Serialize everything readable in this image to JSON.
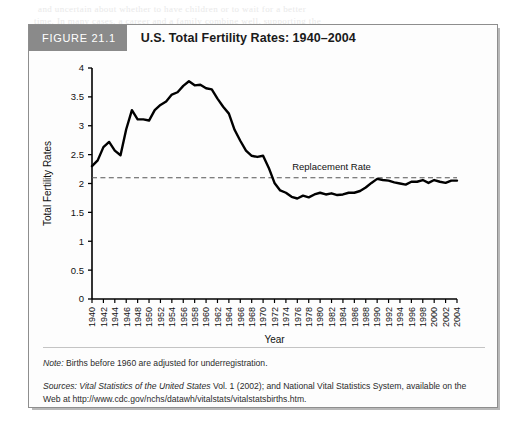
{
  "figure": {
    "badge": "FIGURE 21.1",
    "title": "U.S. Total Fertility Rates: 1940–2004"
  },
  "notes": {
    "note_label": "Note:",
    "note_text": " Births before 1960 are adjusted for underregistration.",
    "sources_label": "Sources:",
    "sources_italic": " Vital Statistics of the United States",
    "sources_text_1": " Vol. 1 (2002); and National Vital Statistics System, available on the",
    "sources_text_2": "Web at http://www.cdc.gov/nchs/datawh/vitalstats/vitalstatsbirths.htm."
  },
  "bleed_text": [
    "and uncertain about whether to have children or to wait for a better",
    "time. In many cases, a career and a family combine well, supporting the"
  ],
  "chart_data": {
    "type": "line",
    "title": "U.S. Total Fertility Rates: 1940–2004",
    "xlabel": "Year",
    "ylabel": "Total Fertility Rates",
    "ylim": [
      0,
      4
    ],
    "xlim": [
      1940,
      2004
    ],
    "yticks": [
      0,
      0.5,
      1,
      1.5,
      2,
      2.5,
      3,
      3.5,
      4
    ],
    "ytick_labels": [
      "0",
      "0.5",
      "1",
      "1.5",
      "2",
      "2.5",
      "3",
      "3.5",
      "4"
    ],
    "xticks": [
      1940,
      1942,
      1944,
      1946,
      1948,
      1950,
      1952,
      1954,
      1956,
      1958,
      1960,
      1962,
      1964,
      1966,
      1968,
      1970,
      1972,
      1974,
      1976,
      1978,
      1980,
      1982,
      1984,
      1986,
      1988,
      1990,
      1992,
      1994,
      1996,
      1998,
      2000,
      2002,
      2004
    ],
    "xtick_labels": [
      "1940",
      "1942",
      "1944",
      "1946",
      "1948",
      "1950",
      "1952",
      "1954",
      "1956",
      "1958",
      "1960",
      "1962",
      "1964",
      "1966",
      "1968",
      "1970",
      "1972",
      "1974",
      "1976",
      "1978",
      "1980",
      "1982",
      "1984",
      "1986",
      "1988",
      "1990",
      "1992",
      "1994",
      "1996",
      "1998",
      "2000",
      "2002",
      "2004"
    ],
    "grid": false,
    "legend": "none",
    "line_color": "#000000",
    "annotations": [
      {
        "name": "replacement-rate",
        "label": "Replacement Rate",
        "y": 2.1,
        "style": "dashed-horizontal-line",
        "color": "#555555"
      }
    ],
    "series": [
      {
        "name": "Total Fertility Rate",
        "x": [
          1940,
          1941,
          1942,
          1943,
          1944,
          1945,
          1946,
          1947,
          1948,
          1949,
          1950,
          1951,
          1952,
          1953,
          1954,
          1955,
          1956,
          1957,
          1958,
          1959,
          1960,
          1961,
          1962,
          1963,
          1964,
          1965,
          1966,
          1967,
          1968,
          1969,
          1970,
          1971,
          1972,
          1973,
          1974,
          1975,
          1976,
          1977,
          1978,
          1979,
          1980,
          1981,
          1982,
          1983,
          1984,
          1985,
          1986,
          1987,
          1988,
          1989,
          1990,
          1991,
          1992,
          1993,
          1994,
          1995,
          1996,
          1997,
          1998,
          1999,
          2000,
          2001,
          2002,
          2003,
          2004
        ],
        "values": [
          2.3,
          2.4,
          2.63,
          2.72,
          2.57,
          2.49,
          2.94,
          3.27,
          3.11,
          3.11,
          3.09,
          3.27,
          3.36,
          3.42,
          3.54,
          3.58,
          3.69,
          3.77,
          3.7,
          3.71,
          3.65,
          3.63,
          3.47,
          3.33,
          3.21,
          2.93,
          2.74,
          2.57,
          2.48,
          2.46,
          2.48,
          2.27,
          2.01,
          1.88,
          1.84,
          1.77,
          1.74,
          1.79,
          1.76,
          1.81,
          1.84,
          1.81,
          1.83,
          1.8,
          1.81,
          1.84,
          1.84,
          1.87,
          1.93,
          2.01,
          2.08,
          2.06,
          2.05,
          2.02,
          2.0,
          1.98,
          2.03,
          2.03,
          2.06,
          2.01,
          2.06,
          2.03,
          2.01,
          2.05,
          2.05
        ]
      }
    ]
  }
}
